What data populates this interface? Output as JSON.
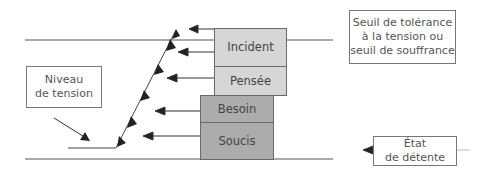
{
  "diagram": {
    "stack_boxes": [
      {
        "label": "Incident",
        "shade": "light",
        "color": "#d6d6d6"
      },
      {
        "label": "Pensée",
        "shade": "light",
        "color": "#d6d6d6"
      },
      {
        "label": "Besoin",
        "shade": "dark",
        "color": "#acacac"
      },
      {
        "label": "Soucis",
        "shade": "dark",
        "color": "#acacac"
      }
    ],
    "labels": {
      "tension_level": "Niveau de tension",
      "tolerance_threshold": "Seuil de tolérance à la tension ou seuil de souffrance",
      "tolerance_threshold_lines": [
        "Seuil de tolérance",
        "à la tension ou",
        "seuil de souffrance"
      ],
      "relaxation_state_lines": [
        "État",
        "de détente"
      ],
      "tension_level_lines": [
        "Niveau",
        "de tension"
      ]
    },
    "lines": {
      "upper": "tolerance-threshold-line",
      "lower": "relaxation-line"
    },
    "icons": {
      "arrow": "arrow-left-icon",
      "step_marker": "triangle-up-icon"
    }
  }
}
